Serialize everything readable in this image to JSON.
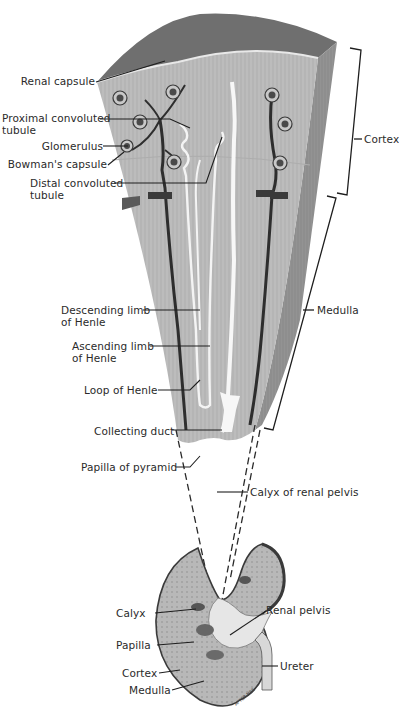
{
  "figure": {
    "signature": "AFTER NBE",
    "colors": {
      "background": "#ffffff",
      "wedge_top": "#6e6e6e",
      "wedge_face": "#bdbdbd",
      "wedge_side": "#8f8f8f",
      "vessel": "#2e2e2e",
      "tubule": "#f4f4f4",
      "leader": "#1e1e1e"
    }
  },
  "labels_left": [
    {
      "id": "renal-capsule",
      "lines": [
        "Renal capsule"
      ]
    },
    {
      "id": "proximal-convoluted-tubule",
      "lines": [
        "Proximal convoluted",
        "tubule"
      ]
    },
    {
      "id": "glomerulus",
      "lines": [
        "Glomerulus"
      ]
    },
    {
      "id": "bowmans-capsule",
      "lines": [
        "Bowman's capsule"
      ]
    },
    {
      "id": "distal-convoluted-tubule",
      "lines": [
        "Distal convoluted",
        "tubule"
      ]
    },
    {
      "id": "descending-limb",
      "lines": [
        "Descending limb",
        "of Henle"
      ]
    },
    {
      "id": "ascending-limb",
      "lines": [
        "Ascending limb",
        "of Henle"
      ]
    },
    {
      "id": "loop-of-henle",
      "lines": [
        "Loop of Henle"
      ]
    },
    {
      "id": "collecting-duct",
      "lines": [
        "Collecting duct"
      ]
    },
    {
      "id": "papilla-of-pyramid",
      "lines": [
        "Papilla of pyramid"
      ]
    }
  ],
  "labels_right": [
    {
      "id": "cortex-bracket",
      "lines": [
        "Cortex"
      ]
    },
    {
      "id": "medulla-bracket",
      "lines": [
        "Medulla"
      ]
    },
    {
      "id": "calyx-of-renal-pelvis",
      "lines": [
        "Calyx of renal pelvis"
      ]
    }
  ],
  "kidney_labels": [
    {
      "id": "calyx",
      "lines": [
        "Calyx"
      ]
    },
    {
      "id": "papilla",
      "lines": [
        "Papilla"
      ]
    },
    {
      "id": "cortex",
      "lines": [
        "Cortex"
      ]
    },
    {
      "id": "medulla",
      "lines": [
        "Medulla"
      ]
    },
    {
      "id": "renal-pelvis",
      "lines": [
        "Renal pelvis"
      ]
    },
    {
      "id": "ureter",
      "lines": [
        "Ureter"
      ]
    }
  ]
}
